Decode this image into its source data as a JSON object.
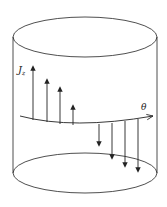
{
  "diagram": {
    "type": "cylinder-current-density",
    "labels": {
      "current_density": "J",
      "current_density_subscript": "z",
      "azimuthal_axis": "θ"
    },
    "colors": {
      "stroke": "#222222",
      "background": "#ffffff"
    },
    "arrows_up_count": 4,
    "arrows_down_count": 4
  }
}
